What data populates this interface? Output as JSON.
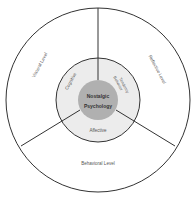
{
  "diagram": {
    "center": {
      "line1": "Nostalgic",
      "line2": "Psychology"
    },
    "inner_ring": {
      "cognitive": "Cognitive",
      "behavior_line1": "Behavior",
      "behavior_line2": "Tendency",
      "affective": "Affective"
    },
    "outer_ring": {
      "visceral": "Visceral Level",
      "reflective": "Reflective Level",
      "behavioral": "Behavioral Level"
    },
    "colors": {
      "outer_fill": "#ffffff",
      "inner_ring_fill": "#ececec",
      "center_fill": "#b0b0b0",
      "stroke": "#333333"
    }
  }
}
